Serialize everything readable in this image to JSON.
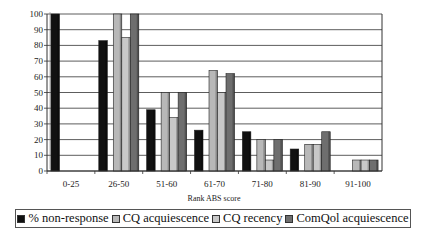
{
  "chart_data": {
    "type": "bar",
    "title": "",
    "xlabel": "Rank ABS score",
    "ylabel": "",
    "ylim": [
      0,
      100
    ],
    "yticks": [
      0,
      10,
      20,
      30,
      40,
      50,
      60,
      70,
      80,
      90,
      100
    ],
    "grid": true,
    "legend_position": "bottom",
    "categories": [
      "0-25",
      "26-50",
      "51-60",
      "61-70",
      "71-80",
      "81-90",
      "91-100"
    ],
    "series": [
      {
        "name": "% non-response",
        "color": "#111111",
        "values": [
          100,
          83,
          39,
          26,
          25,
          14,
          0
        ]
      },
      {
        "name": "CQ acquiescence",
        "color": "#b8b8b8",
        "values": [
          0,
          100,
          50,
          64,
          20,
          17,
          7
        ]
      },
      {
        "name": "CQ recency",
        "color": "#c8c8c8",
        "values": [
          0,
          85,
          34,
          50,
          7,
          17,
          7
        ]
      },
      {
        "name": "ComQol acquiescence",
        "color": "#6e6e6e",
        "values": [
          0,
          100,
          50,
          62,
          20,
          25,
          7
        ]
      }
    ]
  },
  "legend": {
    "items": [
      {
        "label": "% non-response"
      },
      {
        "label": "CQ acquiescence"
      },
      {
        "label": "CQ recency"
      },
      {
        "label": "ComQol acquiescence"
      }
    ]
  }
}
